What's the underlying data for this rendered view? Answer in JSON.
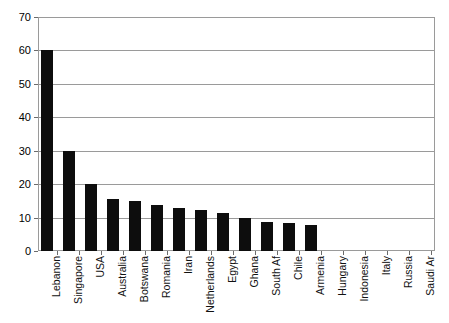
{
  "chart_data": {
    "type": "bar",
    "title": "",
    "xlabel": "",
    "ylabel": "",
    "ylim": [
      0,
      70
    ],
    "ytick_step": 10,
    "yticks": [
      "0",
      "10",
      "20",
      "30",
      "40",
      "50",
      "60",
      "70"
    ],
    "grid": true,
    "legend": false,
    "bar_color": "#0d0d0d",
    "grid_color": "#9a9a9a",
    "categories": [
      "Lebanon",
      "Singapore",
      "USA",
      "Australia",
      "Botswana",
      "Romania",
      "Iran",
      "Netherlands",
      "Egypt",
      "Ghana",
      "South Af",
      "Chile",
      "Armenia",
      "Hungary",
      "Indonesia",
      "Italy",
      "Russia",
      "Saudi Ar"
    ],
    "values": [
      60,
      30,
      20,
      15.5,
      15,
      13.8,
      13,
      12.3,
      11.5,
      10,
      8.8,
      8.4,
      7.8,
      0,
      0,
      0,
      0,
      0
    ]
  }
}
